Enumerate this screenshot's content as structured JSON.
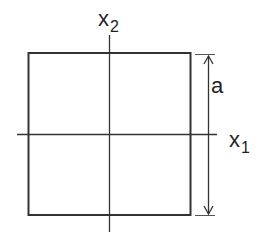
{
  "diagram": {
    "labels": {
      "x2": "x",
      "x2_sub": "2",
      "x1": "x",
      "x1_sub": "1",
      "dimension": "a"
    },
    "colors": {
      "stroke": "#333333",
      "text": "#222222",
      "background": "#ffffff"
    }
  }
}
